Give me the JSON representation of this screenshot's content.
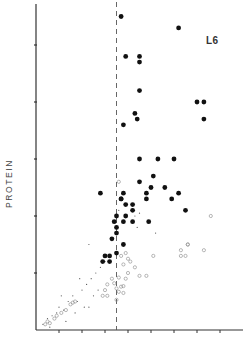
{
  "chart_data": {
    "type": "scatter",
    "title": "",
    "panel_label": "L6",
    "xlabel": "",
    "ylabel": "PROTEIN",
    "x_ticks": [
      1,
      2,
      3,
      4,
      5,
      6,
      7,
      8
    ],
    "y_ticks": [
      1,
      2,
      3,
      4,
      5
    ],
    "xlim": [
      0,
      9
    ],
    "ylim": [
      0,
      5.7
    ],
    "grid": false,
    "legend": null,
    "reference_line": {
      "type": "vertical",
      "style": "dashed",
      "x": 3.5
    },
    "series": [
      {
        "name": "filled circles",
        "marker": "filled-circle",
        "points": [
          [
            3.7,
            5.5
          ],
          [
            6.2,
            5.3
          ],
          [
            3.9,
            4.8
          ],
          [
            4.5,
            4.8
          ],
          [
            4.5,
            4.7
          ],
          [
            4.5,
            4.2
          ],
          [
            4.3,
            3.8
          ],
          [
            4.4,
            3.7
          ],
          [
            3.8,
            3.6
          ],
          [
            7.0,
            4.0
          ],
          [
            7.3,
            4.0
          ],
          [
            7.3,
            3.7
          ],
          [
            4.5,
            3.0
          ],
          [
            5.3,
            3.0
          ],
          [
            6.0,
            3.0
          ],
          [
            5.1,
            2.7
          ],
          [
            4.5,
            2.6
          ],
          [
            5.6,
            2.5
          ],
          [
            5.0,
            2.5
          ],
          [
            2.8,
            2.4
          ],
          [
            3.8,
            2.4
          ],
          [
            4.8,
            2.4
          ],
          [
            3.7,
            2.3
          ],
          [
            3.7,
            2.3
          ],
          [
            5.9,
            2.3
          ],
          [
            4.8,
            2.3
          ],
          [
            6.2,
            2.4
          ],
          [
            6.5,
            2.1
          ],
          [
            3.9,
            2.2
          ],
          [
            4.2,
            2.2
          ],
          [
            3.5,
            2.0
          ],
          [
            3.9,
            2.0
          ],
          [
            4.2,
            2.1
          ],
          [
            4.9,
            1.9
          ],
          [
            3.4,
            1.9
          ],
          [
            3.8,
            1.9
          ],
          [
            4.2,
            1.9
          ],
          [
            3.5,
            1.8
          ],
          [
            3.5,
            1.7
          ],
          [
            3.3,
            1.6
          ],
          [
            3.8,
            1.5
          ],
          [
            3.2,
            1.3
          ],
          [
            3.0,
            1.3
          ],
          [
            3.5,
            1.35
          ],
          [
            2.9,
            1.2
          ],
          [
            3.2,
            1.2
          ]
        ]
      },
      {
        "name": "open circles",
        "marker": "open-circle",
        "points": [
          [
            3.6,
            2.6
          ],
          [
            7.6,
            2.0
          ],
          [
            6.6,
            1.5
          ],
          [
            6.6,
            1.5
          ],
          [
            6.3,
            1.4
          ],
          [
            6.3,
            1.3
          ],
          [
            6.5,
            1.3
          ],
          [
            7.3,
            1.4
          ],
          [
            5.1,
            1.3
          ],
          [
            3.7,
            1.3
          ],
          [
            3.9,
            1.35
          ],
          [
            4.0,
            1.25
          ],
          [
            4.1,
            1.2
          ],
          [
            3.8,
            1.15
          ],
          [
            4.0,
            1.0
          ],
          [
            4.3,
            1.1
          ],
          [
            4.5,
            0.95
          ],
          [
            4.8,
            0.95
          ],
          [
            3.3,
            0.9
          ],
          [
            3.6,
            0.92
          ],
          [
            3.9,
            0.9
          ],
          [
            3.1,
            0.8
          ],
          [
            3.4,
            0.82
          ],
          [
            3.7,
            0.76
          ],
          [
            3.0,
            0.7
          ],
          [
            3.5,
            0.73
          ],
          [
            3.8,
            0.77
          ],
          [
            3.1,
            0.6
          ],
          [
            3.8,
            0.65
          ],
          [
            3.5,
            0.53
          ],
          [
            2.9,
            0.6
          ],
          [
            3.6,
            0.67
          ],
          [
            0.5,
            0.15
          ],
          [
            0.6,
            0.12
          ],
          [
            0.4,
            0.1
          ],
          [
            0.8,
            0.2
          ],
          [
            0.9,
            0.25
          ],
          [
            1.1,
            0.3
          ],
          [
            1.3,
            0.35
          ],
          [
            1.5,
            0.45
          ],
          [
            1.6,
            0.48
          ],
          [
            1.7,
            0.5
          ]
        ]
      },
      {
        "name": "small dots",
        "marker": "dot",
        "points": [
          [
            0.3,
            0.1
          ],
          [
            0.5,
            0.2
          ],
          [
            0.7,
            0.25
          ],
          [
            0.9,
            0.3
          ],
          [
            1.0,
            0.4
          ],
          [
            1.2,
            0.35
          ],
          [
            1.4,
            0.5
          ],
          [
            1.6,
            0.6
          ],
          [
            1.8,
            0.5
          ],
          [
            2.0,
            0.7
          ],
          [
            2.2,
            0.8
          ],
          [
            2.4,
            0.9
          ],
          [
            2.6,
            1.0
          ],
          [
            2.8,
            1.1
          ],
          [
            3.0,
            1.2
          ],
          [
            1.9,
            0.9
          ],
          [
            2.3,
            1.5
          ],
          [
            1.7,
            0.3
          ],
          [
            2.1,
            0.4
          ],
          [
            2.3,
            0.4
          ],
          [
            2.5,
            0.6
          ],
          [
            2.7,
            0.7
          ],
          [
            4.4,
            1.8
          ],
          [
            4.3,
            2.0
          ],
          [
            5.2,
            1.7
          ],
          [
            3.6,
            2.1
          ],
          [
            4.5,
            2.05
          ],
          [
            1.3,
            0.15
          ],
          [
            1.1,
            0.6
          ],
          [
            0.6,
            0.05
          ]
        ]
      }
    ]
  }
}
